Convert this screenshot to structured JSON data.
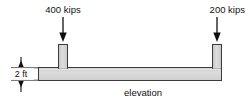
{
  "figure": {
    "type": "structural-elevation-diagram",
    "caption": "elevation",
    "colors": {
      "member_fill": "#d2d2d2",
      "member_fill_light": "#e6e6e6",
      "outline": "#3b3b3b",
      "text": "#111111",
      "arrow": "#111111",
      "background": "#ffffff"
    },
    "loads": [
      {
        "name": "left-point-load",
        "label": "400 kips",
        "magnitude": 400,
        "unit": "kips",
        "direction": "down"
      },
      {
        "name": "right-point-load",
        "label": "200 kips",
        "magnitude": 200,
        "unit": "kips",
        "direction": "down"
      }
    ],
    "dimensions": [
      {
        "name": "beam-depth",
        "label": "2 ft",
        "value": 2,
        "unit": "ft",
        "orientation": "vertical"
      }
    ],
    "members": [
      {
        "name": "horizontal-beam",
        "role": "beam"
      },
      {
        "name": "left-vertical-stub",
        "role": "column"
      },
      {
        "name": "right-vertical-stub",
        "role": "column"
      }
    ]
  }
}
